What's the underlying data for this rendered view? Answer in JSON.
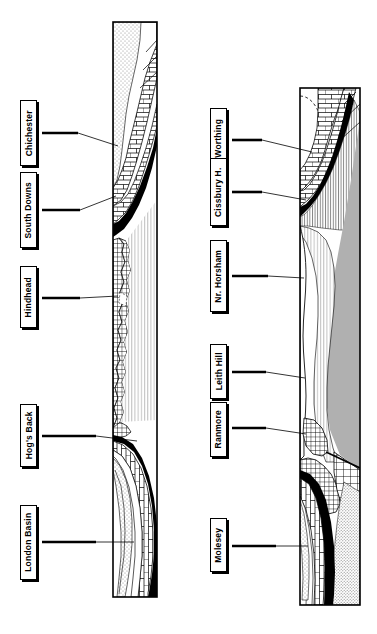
{
  "figure": {
    "type": "geological-cross-section",
    "orientation": "rotated-90-ccw",
    "panel_count": 2,
    "background_color": "#ffffff",
    "line_color": "#000000"
  },
  "panels": [
    {
      "id": "panel-left",
      "name": "left-cross-section",
      "labels": [
        {
          "id": "chichester",
          "text": "Chichester"
        },
        {
          "id": "south-downs",
          "text": "South Downs"
        },
        {
          "id": "hindhead",
          "text": "Hindhead"
        },
        {
          "id": "hogs-back",
          "text": "Hog's Back"
        },
        {
          "id": "london-basin",
          "text": "London Basin"
        }
      ]
    },
    {
      "id": "panel-right",
      "name": "right-cross-section",
      "labels": [
        {
          "id": "worthing",
          "text": "Worthing"
        },
        {
          "id": "cissbury-h",
          "text": "Cissbury H."
        },
        {
          "id": "nr-horsham",
          "text": "Nr. Horsham"
        },
        {
          "id": "leith-hill",
          "text": "Leith Hill"
        },
        {
          "id": "ranmore",
          "text": "Ranmore"
        },
        {
          "id": "molesey",
          "text": "Molesey"
        }
      ]
    }
  ],
  "strata_patterns": {
    "stipple": {
      "name": "stippled-clay",
      "color": "#e8e8e8"
    },
    "brick": {
      "name": "brick-chalk",
      "color": "#ffffff"
    },
    "solid_black": {
      "name": "solid-black-bed",
      "color": "#000000"
    },
    "crosshatch": {
      "name": "crosshatch-wealden",
      "color": "#ffffff"
    },
    "vertical": {
      "name": "vertical-hatch",
      "color": "#ffffff"
    },
    "gray_mass": {
      "name": "gray-core-mass",
      "color": "#b0b0b0"
    },
    "fine_stipple": {
      "name": "fine-stipple-base",
      "color": "#d0d0d0"
    }
  }
}
